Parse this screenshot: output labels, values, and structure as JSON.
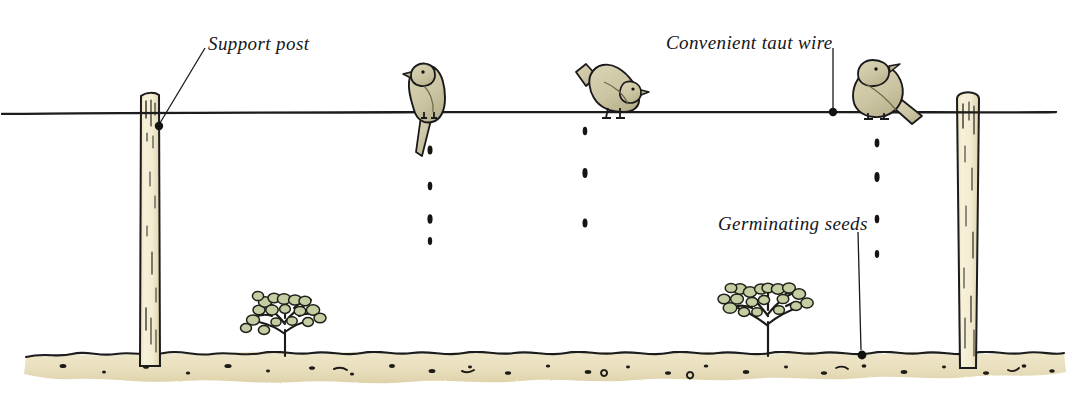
{
  "figure": {
    "domain_note": "hand-drawn pen-and-ink illustration with watercolour wash",
    "width": 1091,
    "height": 393
  },
  "colors": {
    "ink": "#1a1a1c",
    "background": "#ffffff",
    "post_fill": "#f4efd4",
    "post_shade": "#e2d9b4",
    "bird_fill": "#cdc7a6",
    "bird_shade": "#b9b18c",
    "soil_fill": "#efe6c8",
    "soil_shade": "#ded2ab",
    "leaf_fill": "#c3cfa2",
    "leaf_shade": "#a9b885",
    "stem": "#1d1c18",
    "label_text": "#16161a"
  },
  "labels": [
    {
      "id": "support-post",
      "text": "Support post",
      "leader": "diagonal line from label down-left to a dot on the left post just below the wire"
    },
    {
      "id": "taut-wire",
      "text": "Convenient taut wire",
      "leader": "vertical line from label down to a dot sitting on the wire"
    },
    {
      "id": "germinating-seeds",
      "text": "Germinating seeds",
      "leader": "vertical line from label down to a dot resting on the soil surface"
    }
  ],
  "scene": {
    "wire": {
      "name": "taut wire",
      "y": 113,
      "x_start": 0,
      "x_end": 1058,
      "stroke": "#1a1a1c"
    },
    "ground": {
      "name": "soil band",
      "top_y": 352,
      "bottom_y": 380,
      "x_start": 24,
      "x_end": 1066,
      "speckle_count": 34
    },
    "posts": [
      {
        "id": "left-post",
        "x": 140,
        "top_y": 92,
        "bottom_y": 366,
        "width": 20,
        "top_shape": "flat"
      },
      {
        "id": "right-post",
        "x": 955,
        "top_y": 88,
        "bottom_y": 368,
        "width": 22,
        "top_shape": "rounded"
      }
    ],
    "birds": [
      {
        "id": "bird-1",
        "x": 428,
        "pose": "upright, facing left, long tail hanging below the wire"
      },
      {
        "id": "bird-2",
        "x": 611,
        "pose": "crouched, leaning forward facing right, tail cocked up and back"
      },
      {
        "id": "bird-3",
        "x": 880,
        "pose": "plump, facing right, tail trailing down to the right"
      }
    ],
    "seed_falls": [
      {
        "id": "seed-column-1",
        "x": 430,
        "under_bird": "bird-1",
        "seeds_y": [
          148,
          184,
          218,
          240
        ]
      },
      {
        "id": "seed-column-2",
        "x": 585,
        "under_bird": "bird-2",
        "seeds_y": [
          130,
          172,
          222
        ]
      },
      {
        "id": "seed-column-3",
        "x": 877,
        "under_bird": "bird-3",
        "seeds_y": [
          142,
          176,
          218,
          252
        ]
      }
    ],
    "seedlings": [
      {
        "id": "seedling-left",
        "x": 285,
        "base_y": 356,
        "height": 62,
        "note": "young plant grown from a dropped seed"
      },
      {
        "id": "seedling-right",
        "x": 768,
        "base_y": 356,
        "height": 72,
        "note": "young plant grown from a dropped seed"
      }
    ]
  }
}
